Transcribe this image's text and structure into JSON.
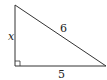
{
  "diagram": {
    "type": "right-triangle",
    "labels": {
      "vertical_leg": "x",
      "hypotenuse": "6",
      "horizontal_leg": "5"
    },
    "right_angle_marker": true,
    "stroke_color": "#333333"
  }
}
